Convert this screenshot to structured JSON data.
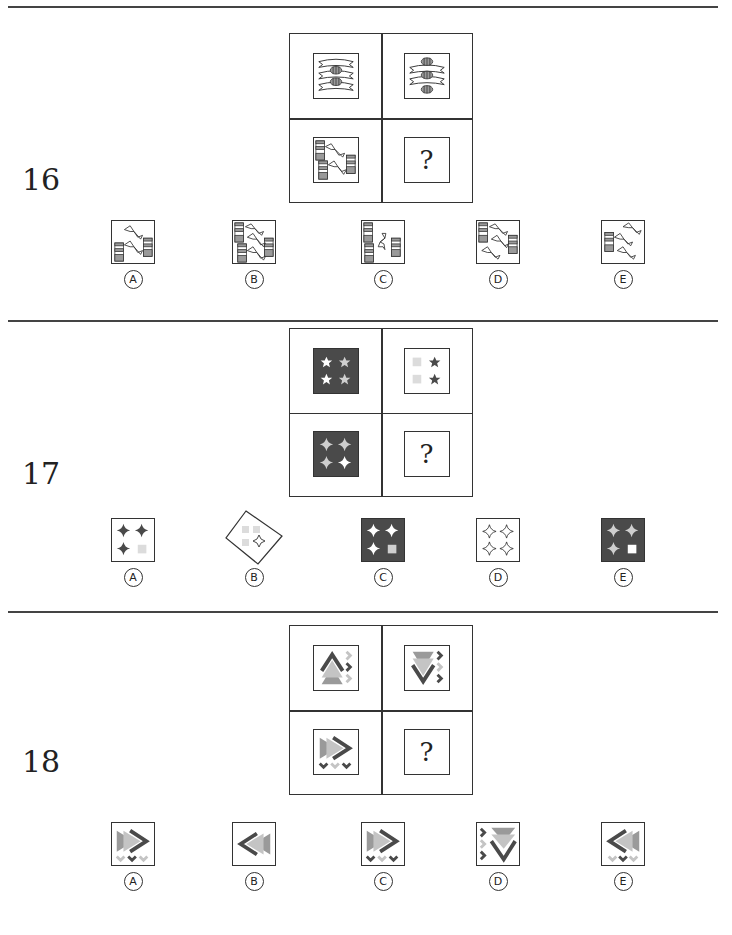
{
  "questions": [
    {
      "number": "16",
      "matrix": {
        "cells": [
          {
            "position": "top-left",
            "content": "two ring-bands between three horizontal bowtie shapes"
          },
          {
            "position": "top-right",
            "content": "three ring-bands between two horizontal bowtie shapes"
          },
          {
            "position": "bottom-left",
            "content": "three striped bars with two bowtie connectors"
          },
          {
            "position": "bottom-right",
            "content": "?"
          }
        ],
        "question_mark": "?"
      },
      "options": [
        {
          "label": "A",
          "content": "two striped bars, two bowties"
        },
        {
          "label": "B",
          "content": "three striped bars, three bowties"
        },
        {
          "label": "C",
          "content": "three striped bars, one vertical bowtie"
        },
        {
          "label": "D",
          "content": "two striped bars, three bowties"
        },
        {
          "label": "E",
          "content": "one striped bar, three bowties"
        }
      ]
    },
    {
      "number": "17",
      "matrix": {
        "cells": [
          {
            "position": "top-left",
            "content": "dark square with four stars (2 white, 2 light gray)"
          },
          {
            "position": "top-right",
            "content": "white square with two light squares and two dark stars"
          },
          {
            "position": "bottom-left",
            "content": "dark square with four four-point stars (3 light gray, 1 white)"
          },
          {
            "position": "bottom-right",
            "content": "?"
          }
        ],
        "question_mark": "?"
      },
      "options": [
        {
          "label": "A",
          "content": "white square with three dark four-point stars and one light square"
        },
        {
          "label": "B",
          "content": "rotated white square with three light squares and one outlined four-point star"
        },
        {
          "label": "C",
          "content": "dark square with three white four-point stars and one light square"
        },
        {
          "label": "D",
          "content": "white square with four outlined four-point stars"
        },
        {
          "label": "E",
          "content": "dark square with three light four-point stars and one white square"
        }
      ]
    },
    {
      "number": "18",
      "matrix": {
        "cells": [
          {
            "position": "top-left",
            "content": "up chevron with stacked triangles, right chevrons column"
          },
          {
            "position": "top-right",
            "content": "down chevron with stacked triangles, right chevrons column"
          },
          {
            "position": "bottom-left",
            "content": "right chevron with stacked triangles, bottom chevrons row"
          },
          {
            "position": "bottom-right",
            "content": "?"
          }
        ],
        "question_mark": "?"
      },
      "options": [
        {
          "label": "A",
          "content": "right chevron, bottom row light-dark-light"
        },
        {
          "label": "B",
          "content": "left chevron, no small chevrons"
        },
        {
          "label": "C",
          "content": "right chevron, bottom row dark-light-dark"
        },
        {
          "label": "D",
          "content": "down chevron, left column of small chevrons"
        },
        {
          "label": "E",
          "content": "left chevron, bottom row light-dark-light"
        }
      ]
    }
  ],
  "colors": {
    "ink": "#333333",
    "dark_fill": "#4a4a4a",
    "mid_gray": "#9a9a9a",
    "light_gray": "#cfcfcf",
    "white": "#ffffff"
  }
}
